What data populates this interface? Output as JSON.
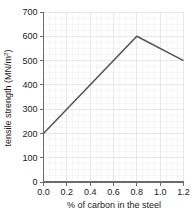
{
  "chart_data": {
    "type": "line",
    "title": "",
    "subtitle": "",
    "xlabel": "% of carbon in the steel",
    "ylabel": "tensile strength (MN/m²)",
    "ylabel_base": "tensile strength (MN/m",
    "ylabel_superscript": "2",
    "ylabel_close": ")",
    "xlim": [
      0.0,
      1.2
    ],
    "ylim": [
      0,
      700
    ],
    "x": [
      0.0,
      0.8,
      1.2
    ],
    "values": [
      200,
      600,
      500
    ],
    "series": [
      {
        "name": "tensile strength",
        "color": "#555555",
        "points": [
          {
            "x": 0.0,
            "y": 200
          },
          {
            "x": 0.8,
            "y": 600
          },
          {
            "x": 1.2,
            "y": 500
          }
        ]
      }
    ],
    "xticks": [
      0.0,
      0.2,
      0.4,
      0.6,
      0.8,
      1.0,
      1.2
    ],
    "xtick_labels": [
      "0.0",
      "0.2",
      "0.4",
      "0.6",
      "0.8",
      "1.0",
      "1.2"
    ],
    "yticks": [
      0,
      100,
      200,
      300,
      400,
      500,
      600,
      700
    ],
    "ytick_labels": [
      "0",
      "100",
      "200",
      "300",
      "400",
      "500",
      "600",
      "700"
    ],
    "grid": true,
    "grid_minor": true,
    "legend": false,
    "legend_position": "none",
    "annotations": [],
    "background_color": "#ffffff",
    "axis_color": "#6b6b6b",
    "grid_major_color": "#e2e2e2",
    "grid_minor_color": "#f0f0f0",
    "text_color": "#1a1a1a"
  }
}
